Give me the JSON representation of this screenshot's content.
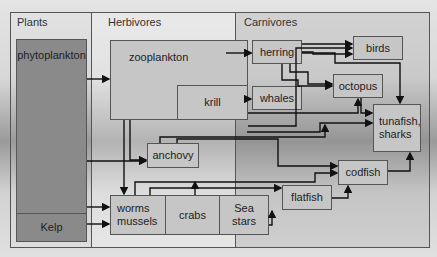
{
  "sections": {
    "plants": "Plants",
    "herbivores": "Herbivores",
    "carnivores": "Carnivores"
  },
  "nodes": {
    "phytoplankton": "phytoplankton",
    "kelp": "Kelp",
    "zooplankton": "zooplankton",
    "krill": "krill",
    "anchovy": "anchovy",
    "worms_mussels": "worms mussels",
    "crabs": "crabs",
    "sea_stars": "Sea stars",
    "herring": "herring",
    "whales": "whales",
    "birds": "birds",
    "octopus": "octopus",
    "tunafish_sharks": "tunafish, sharks",
    "codfish": "codfish",
    "flatfish": "flatfish"
  }
}
